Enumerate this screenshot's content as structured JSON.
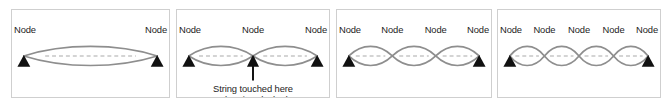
{
  "figure": {
    "background_color": "#ffffff",
    "panel_border_color": "#cfcfcf",
    "wave_stroke_color": "#8e8e8e",
    "axis_dash_color": "#a9a9a9",
    "node_marker_color": "#111111",
    "node_label_text": "Node"
  },
  "panels": [
    {
      "id": "panel-1",
      "harmonic": 1,
      "node_count": 2,
      "antinode_count": 1,
      "x": 11,
      "width": 159,
      "node_labels": [
        "Node",
        "Node"
      ],
      "node_label_positions": [
        0,
        1
      ],
      "end_marker_count": 2,
      "caption": null,
      "has_pluck_arrow": false
    },
    {
      "id": "panel-2",
      "harmonic": 2,
      "node_count": 3,
      "antinode_count": 2,
      "x": 176,
      "width": 154,
      "node_labels": [
        "Node",
        "Node",
        "Node"
      ],
      "node_label_positions": [
        0,
        1,
        2
      ],
      "end_marker_count": 2,
      "caption": {
        "line1": "String touched here",
        "line2": "when it's plucked"
      },
      "has_pluck_arrow": true,
      "pluck_arrow_at_node_index": 1
    },
    {
      "id": "panel-3",
      "harmonic": 3,
      "node_count": 4,
      "antinode_count": 3,
      "x": 336,
      "width": 156,
      "node_labels": [
        "Node",
        "Node",
        "Node",
        "Node"
      ],
      "node_label_positions": [
        0,
        1,
        2,
        3
      ],
      "end_marker_count": 2,
      "caption": null,
      "has_pluck_arrow": false
    },
    {
      "id": "panel-4",
      "harmonic": 4,
      "node_count": 5,
      "antinode_count": 4,
      "x": 497,
      "width": 164,
      "node_labels": [
        "Node",
        "Node",
        "Node",
        "Node",
        "Node"
      ],
      "node_label_positions": [
        0,
        1,
        2,
        3,
        4
      ],
      "end_marker_count": 2,
      "caption": null,
      "has_pluck_arrow": false
    }
  ],
  "chart_data": {
    "type": "line",
    "xlabel": "",
    "ylabel": "",
    "series": [
      {
        "name": "1st harmonic (fundamental)",
        "antinodes": 1,
        "nodes": 2
      },
      {
        "name": "2nd harmonic",
        "antinodes": 2,
        "nodes": 3
      },
      {
        "name": "3rd harmonic",
        "antinodes": 3,
        "nodes": 4
      },
      {
        "name": "4th harmonic",
        "antinodes": 4,
        "nodes": 5
      }
    ],
    "annotations": [
      "String touched here",
      "when it's plucked",
      "Node"
    ]
  }
}
